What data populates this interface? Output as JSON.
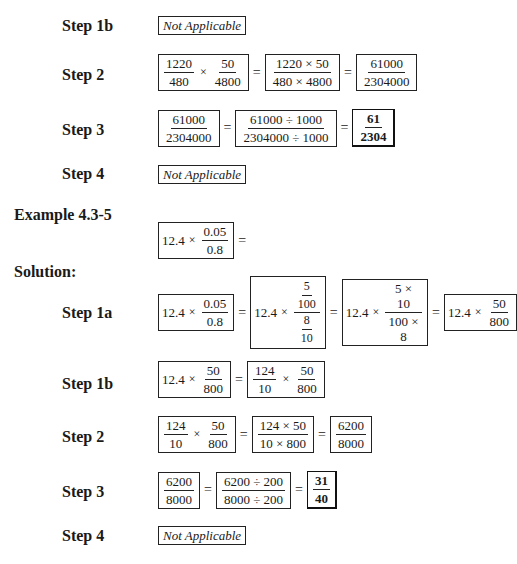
{
  "section1": {
    "steps": [
      {
        "label": "Step 1b",
        "text": "Not Applicable"
      },
      {
        "label": "Step 2",
        "box1": {
          "f1n": "1220",
          "f1d": "480",
          "op": "×",
          "f2n": "50",
          "f2d": "4800"
        },
        "box2": {
          "n": "1220 × 50",
          "d": "480 × 4800"
        },
        "box3": {
          "n": "61000",
          "d": "2304000"
        }
      },
      {
        "label": "Step 3",
        "box1": {
          "n": "61000",
          "d": "2304000"
        },
        "box2": {
          "n": "61000 ÷ 1000",
          "d": "2304000 ÷ 1000"
        },
        "answer": {
          "n": "61",
          "d": "2304"
        }
      },
      {
        "label": "Step 4",
        "text": "Not Applicable"
      }
    ]
  },
  "example": {
    "title": "Example 4.3-5",
    "problem": {
      "whole": "12.4",
      "op": "×",
      "n": "0.05",
      "d": "0.8",
      "eq": "="
    },
    "solution_label": "Solution:"
  },
  "section2": {
    "step1a": {
      "label": "Step 1a",
      "box1": {
        "whole": "12.4",
        "op": "×",
        "n": "0.05",
        "d": "0.8"
      },
      "box2": {
        "whole": "12.4",
        "op": "×",
        "nn": "5",
        "nd": "100",
        "dn": "8",
        "dd": "10"
      },
      "box3": {
        "whole": "12.4",
        "op": "×",
        "n": "5 × 10",
        "d": "100 × 8"
      },
      "box4": {
        "whole": "12.4",
        "op": "×",
        "n": "50",
        "d": "800"
      }
    },
    "step1b": {
      "label": "Step 1b",
      "box1": {
        "whole": "12.4",
        "op": "×",
        "n": "50",
        "d": "800"
      },
      "box2": {
        "f1n": "124",
        "f1d": "10",
        "op": "×",
        "f2n": "50",
        "f2d": "800"
      }
    },
    "step2": {
      "label": "Step 2",
      "box1": {
        "f1n": "124",
        "f1d": "10",
        "op": "×",
        "f2n": "50",
        "f2d": "800"
      },
      "box2": {
        "n": "124 × 50",
        "d": "10 × 800"
      },
      "box3": {
        "n": "6200",
        "d": "8000"
      }
    },
    "step3": {
      "label": "Step 3",
      "box1": {
        "n": "6200",
        "d": "8000"
      },
      "box2": {
        "n": "6200 ÷ 200",
        "d": "8000 ÷ 200"
      },
      "answer": {
        "n": "31",
        "d": "40"
      }
    },
    "step4": {
      "label": "Step 4",
      "text": "Not Applicable"
    }
  },
  "symbols": {
    "equals": "="
  }
}
